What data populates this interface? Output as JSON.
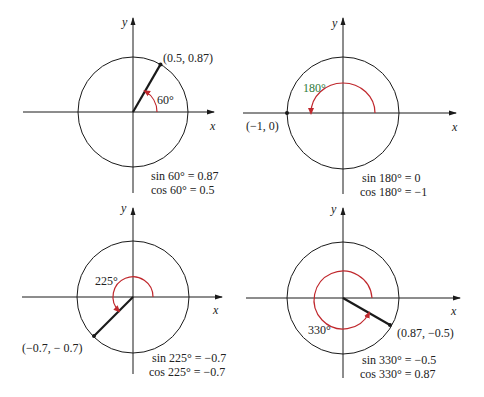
{
  "colors": {
    "ink": "#1a1a1a",
    "arc": "#c0282d",
    "green": "#2f7a3a"
  },
  "axis_labels": {
    "x": "x",
    "y": "y"
  },
  "panels": [
    {
      "id": "p60",
      "angle_label": "60°",
      "point_label": "(0.5, 0.87)",
      "sin_text": "sin 60° = 0.87",
      "cos_text": "cos 60° = 0.5"
    },
    {
      "id": "p180",
      "angle_label": "180°",
      "point_label": "(−1, 0)",
      "sin_text": "sin 180° = 0",
      "cos_text": "cos 180° = −1"
    },
    {
      "id": "p225",
      "angle_label": "225°",
      "point_label": "(−0.7, − 0.7)",
      "sin_text": "sin 225° = −0.7",
      "cos_text": "cos 225° = −0.7"
    },
    {
      "id": "p330",
      "angle_label": "330°",
      "point_label": "(0.87, −0.5)",
      "sin_text": "sin 330° = −0.5",
      "cos_text": "cos 330° = 0.87"
    }
  ]
}
